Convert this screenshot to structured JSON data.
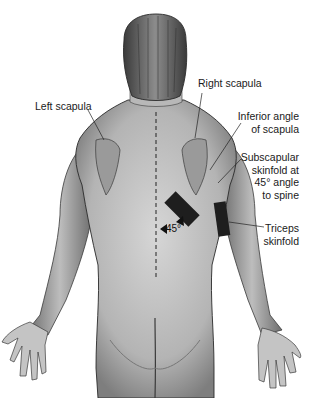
{
  "diagram": {
    "labels": {
      "left_scapula": "Left scapula",
      "right_scapula": "Right scapula",
      "inferior_angle_line1": "Inferior angle",
      "inferior_angle_line2": "of scapula",
      "subscapular_line1": "Subscapular",
      "subscapular_line2": "skinfold at",
      "subscapular_line3": "45° angle",
      "subscapular_line4": "to spine",
      "triceps_line1": "Triceps",
      "triceps_line2": "skinfold",
      "angle": "45°"
    },
    "colors": {
      "skin": "#c8c8c8",
      "shade": "#8a8a8a",
      "outline": "#2a2a2a",
      "marker": "#1a1a1a",
      "background": "#ffffff"
    }
  }
}
